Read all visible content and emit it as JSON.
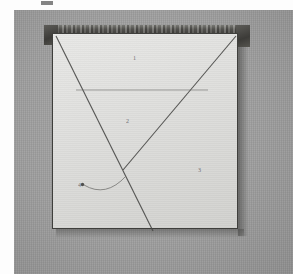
{
  "figure": {
    "kind": "scanned-photograph",
    "caption_fragment": ""
  },
  "background": {
    "page_color": "#fdfdfd",
    "plate_color": "#9d9d9d",
    "sheet_color": "#e2e2e0",
    "ink_color": "#3f3f3c"
  },
  "frame": {
    "top_batten_label": "",
    "corner_left_label": "",
    "corner_right_label": ""
  },
  "annotations": {
    "markers": [
      {
        "id": "marker-1",
        "label": "1",
        "x": 133,
        "y": 55
      },
      {
        "id": "marker-2",
        "label": "2",
        "x": 126,
        "y": 118
      },
      {
        "id": "marker-3",
        "label": "3",
        "x": 198,
        "y": 167
      },
      {
        "id": "marker-4",
        "label": "4",
        "x": 78,
        "y": 182
      }
    ],
    "arrow": {
      "name": "curved-leader-arrow",
      "from_marker": "marker-4",
      "to": "diagonal-crossing-point"
    }
  },
  "geometry": {
    "lines": [
      {
        "name": "diagonal-left-to-bottom",
        "x1": 56,
        "y1": 36,
        "x2": 153,
        "y2": 231
      },
      {
        "name": "diagonal-right-descending",
        "x1": 236,
        "y1": 36,
        "x2": 123,
        "y2": 170
      },
      {
        "name": "horizontal-crease",
        "x1": 76,
        "y1": 90,
        "x2": 208,
        "y2": 90
      }
    ],
    "sheet_rect": {
      "x": 52,
      "y": 33,
      "w": 186,
      "h": 196
    }
  }
}
